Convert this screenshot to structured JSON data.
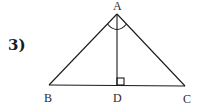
{
  "problem": {
    "number": "3)"
  },
  "diagram": {
    "points": {
      "A": {
        "label": "A",
        "x": 117,
        "y": 14
      },
      "B": {
        "label": "B",
        "x": 49,
        "y": 85
      },
      "C": {
        "label": "C",
        "x": 185,
        "y": 86
      },
      "D": {
        "label": "D",
        "x": 117,
        "y": 85
      }
    },
    "segments": [
      "AB",
      "AC",
      "BC",
      "AD"
    ],
    "marks": {
      "right_angle_at": "D",
      "angle_arcs_at": "A"
    },
    "stroke_color": "#1a1a1a"
  }
}
